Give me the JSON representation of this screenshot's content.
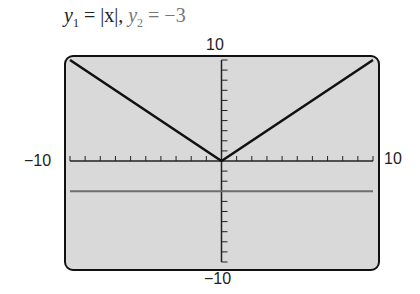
{
  "chart_data": {
    "type": "line",
    "title_parts": {
      "y1_label": "y",
      "y1_sub": "1",
      "y1_expr": " = |x|,  ",
      "y2_label": "y",
      "y2_sub": "2",
      "y2_expr": " = −3"
    },
    "xlim": [
      -10,
      10
    ],
    "ylim": [
      -10,
      10
    ],
    "xscale": 1,
    "yscale": 1,
    "tick_labels": {
      "ymax": "10",
      "ymin": "−10",
      "xmin": "−10",
      "xmax": "10"
    },
    "series": [
      {
        "name": "y1",
        "expr": "|x|",
        "x": [
          -10,
          0,
          10
        ],
        "y": [
          10,
          0,
          10
        ],
        "color": "#111111"
      },
      {
        "name": "y2",
        "expr": "-3",
        "x": [
          -10,
          10
        ],
        "y": [
          -3,
          -3
        ],
        "color": "#6e6e6e"
      }
    ],
    "background": "#d9d9d9",
    "grid": false
  }
}
